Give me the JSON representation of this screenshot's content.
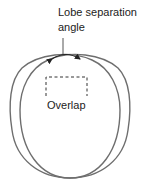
{
  "diagram": {
    "title_line1": "Lobe separation",
    "title_line2": "angle",
    "overlap_label": "Overlap",
    "colors": {
      "stroke": "#6e6e6e",
      "text": "#222222",
      "background": "#ffffff"
    }
  }
}
